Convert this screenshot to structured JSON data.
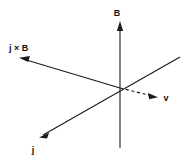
{
  "figure": {
    "background_color": "#ffffff",
    "stroke_color": "#1a1a1a",
    "width": 187,
    "height": 157,
    "origin": {
      "x": 120,
      "y": 88
    }
  },
  "vectors": {
    "b_field": {
      "label": "B",
      "style": "solid",
      "arrowhead": "end",
      "label_x": 120,
      "label_y": 12,
      "from": {
        "x": 120,
        "y": 148
      },
      "to": {
        "x": 120,
        "y": 22
      }
    },
    "j_cross_b": {
      "label": "j × B",
      "style": "solid",
      "arrowhead": "end",
      "label_x": 10,
      "label_y": 48,
      "from": {
        "x": 120,
        "y": 88
      },
      "to": {
        "x": 20,
        "y": 58
      }
    },
    "current_density": {
      "label": "j",
      "style": "solid",
      "arrowhead": "end",
      "label_x": 32,
      "label_y": 152,
      "from": {
        "x": 180,
        "y": 57
      },
      "to": {
        "x": 40,
        "y": 137
      }
    },
    "velocity": {
      "label": "v",
      "style": "dashed",
      "arrowhead": "end",
      "label_x": 166,
      "label_y": 101,
      "from": {
        "x": 120,
        "y": 88
      },
      "to": {
        "x": 157,
        "y": 97
      }
    }
  }
}
